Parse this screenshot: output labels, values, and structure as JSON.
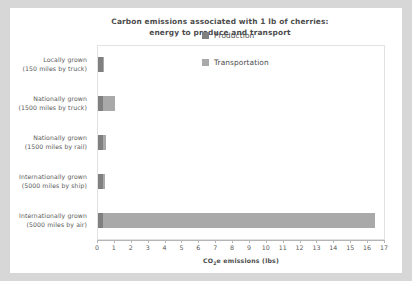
{
  "chart_data": {
    "type": "bar",
    "orientation": "horizontal",
    "stacked": true,
    "title": "Carbon emissions associated with 1 lb of cherries:",
    "subtitle": "energy to produce and transport",
    "xlabel": "CO₂e emissions (lbs)",
    "ylabel": "",
    "xlim": [
      0,
      17
    ],
    "xticks": [
      0,
      1,
      2,
      3,
      4,
      5,
      6,
      7,
      8,
      9,
      10,
      11,
      12,
      13,
      14,
      15,
      16,
      17
    ],
    "grid": false,
    "legend_position": "top-right",
    "categories": [
      {
        "line1": "Locally grown",
        "line2": "(150 miles by truck)"
      },
      {
        "line1": "Nationally  grown",
        "line2": "(1500 miles by truck)"
      },
      {
        "line1": "Nationally  grown",
        "line2": "(1500 miles by rail)"
      },
      {
        "line1": "Internationally grown",
        "line2": "(5000 miles by ship)"
      },
      {
        "line1": "Internationally grown",
        "line2": "(5000 miles by air)"
      }
    ],
    "series": [
      {
        "name": "Production",
        "color": "#808080",
        "values": [
          0.3,
          0.3,
          0.3,
          0.3,
          0.3
        ]
      },
      {
        "name": "Transportation",
        "color": "#a9a9a9",
        "values": [
          0.05,
          0.7,
          0.15,
          0.1,
          16.1
        ]
      }
    ],
    "totals": [
      0.35,
      1.0,
      0.45,
      0.4,
      16.4
    ]
  },
  "legend": {
    "items": [
      {
        "label": "Production",
        "color": "#808080"
      },
      {
        "label": "Transportation",
        "color": "#a9a9a9"
      }
    ]
  },
  "axis": {
    "tick_labels": [
      "0",
      "1",
      "2",
      "3",
      "4",
      "5",
      "6",
      "7",
      "8",
      "9",
      "10",
      "11",
      "12",
      "13",
      "14",
      "15",
      "16",
      "17"
    ],
    "x_label_main": "CO",
    "x_label_sub": "2",
    "x_label_rest": "e emissions (lbs)"
  }
}
